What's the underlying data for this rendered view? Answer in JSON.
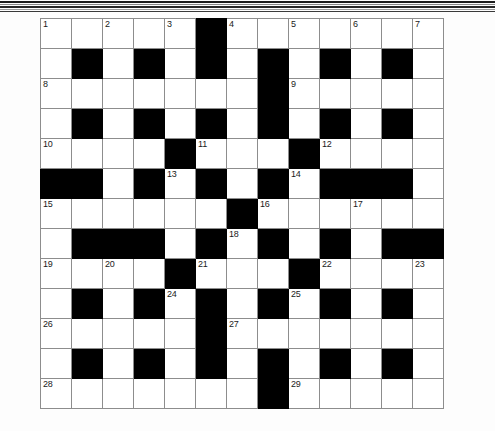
{
  "page": {
    "type": "crossword-puzzle-grid",
    "columns": 13,
    "rows": 13,
    "block_color": "#000000",
    "cell_color": "#ffffff",
    "border_color": "#8d8d8d",
    "number_color": "#1a1a1a"
  },
  "decorations": {
    "scan_bands": [
      "#1d1d1d",
      "#8a8a8a",
      "#272727",
      "#9b9b9b",
      "#3a3a3a"
    ]
  },
  "grid": {
    "legend": {
      "W": "open-cell",
      "B": "blocked-cell"
    },
    "cells": [
      [
        "W",
        "W",
        "W",
        "W",
        "W",
        "B",
        "W",
        "W",
        "W",
        "W",
        "W",
        "W",
        "W"
      ],
      [
        "W",
        "B",
        "W",
        "B",
        "W",
        "B",
        "W",
        "B",
        "W",
        "B",
        "W",
        "B",
        "W"
      ],
      [
        "W",
        "W",
        "W",
        "W",
        "W",
        "W",
        "W",
        "B",
        "W",
        "W",
        "W",
        "W",
        "W"
      ],
      [
        "W",
        "B",
        "W",
        "B",
        "W",
        "B",
        "W",
        "B",
        "W",
        "B",
        "W",
        "B",
        "W"
      ],
      [
        "W",
        "W",
        "W",
        "W",
        "B",
        "W",
        "W",
        "W",
        "B",
        "W",
        "W",
        "W",
        "W"
      ],
      [
        "B",
        "B",
        "W",
        "B",
        "W",
        "B",
        "W",
        "B",
        "W",
        "B",
        "B",
        "B",
        "W"
      ],
      [
        "W",
        "W",
        "W",
        "W",
        "W",
        "W",
        "B",
        "W",
        "W",
        "W",
        "W",
        "W",
        "W"
      ],
      [
        "W",
        "B",
        "B",
        "B",
        "W",
        "B",
        "W",
        "B",
        "W",
        "B",
        "W",
        "B",
        "B"
      ],
      [
        "W",
        "W",
        "W",
        "W",
        "B",
        "W",
        "W",
        "W",
        "B",
        "W",
        "W",
        "W",
        "W"
      ],
      [
        "W",
        "B",
        "W",
        "B",
        "W",
        "B",
        "W",
        "B",
        "W",
        "B",
        "W",
        "B",
        "W"
      ],
      [
        "W",
        "W",
        "W",
        "W",
        "W",
        "B",
        "W",
        "W",
        "W",
        "W",
        "W",
        "W",
        "W"
      ],
      [
        "W",
        "B",
        "W",
        "B",
        "W",
        "B",
        "W",
        "B",
        "W",
        "B",
        "W",
        "B",
        "W"
      ],
      [
        "W",
        "W",
        "W",
        "W",
        "W",
        "W",
        "W",
        "B",
        "W",
        "W",
        "W",
        "W",
        "W"
      ]
    ],
    "numbers": [
      [
        1,
        null,
        2,
        null,
        3,
        null,
        4,
        null,
        5,
        null,
        6,
        null,
        7
      ],
      [
        null,
        null,
        null,
        null,
        null,
        null,
        null,
        null,
        null,
        null,
        null,
        null,
        null
      ],
      [
        8,
        null,
        null,
        null,
        null,
        null,
        null,
        null,
        9,
        null,
        null,
        null,
        null
      ],
      [
        null,
        null,
        null,
        null,
        null,
        null,
        null,
        null,
        null,
        null,
        null,
        null,
        null
      ],
      [
        10,
        null,
        null,
        null,
        null,
        11,
        null,
        null,
        null,
        12,
        null,
        null,
        null
      ],
      [
        null,
        null,
        null,
        null,
        13,
        null,
        null,
        null,
        14,
        null,
        null,
        null,
        null
      ],
      [
        15,
        null,
        null,
        null,
        null,
        null,
        null,
        16,
        null,
        null,
        17,
        null,
        null
      ],
      [
        null,
        null,
        null,
        null,
        null,
        null,
        18,
        null,
        null,
        null,
        null,
        null,
        null
      ],
      [
        19,
        null,
        20,
        null,
        null,
        21,
        null,
        null,
        null,
        22,
        null,
        null,
        23
      ],
      [
        null,
        null,
        null,
        null,
        24,
        null,
        null,
        null,
        25,
        null,
        null,
        null,
        null
      ],
      [
        26,
        null,
        null,
        null,
        null,
        null,
        27,
        null,
        null,
        null,
        null,
        null,
        null
      ],
      [
        null,
        null,
        null,
        null,
        null,
        null,
        null,
        null,
        null,
        null,
        null,
        null,
        null
      ],
      [
        28,
        null,
        null,
        null,
        null,
        null,
        null,
        null,
        29,
        null,
        null,
        null,
        null
      ]
    ],
    "letters": [
      [
        "",
        "",
        "",
        "",
        "",
        "",
        "",
        "",
        "",
        "",
        "",
        "",
        ""
      ],
      [
        "",
        "",
        "",
        "",
        "",
        "",
        "",
        "",
        "",
        "",
        "",
        "",
        ""
      ],
      [
        "",
        "",
        "",
        "",
        "",
        "",
        "",
        "",
        "",
        "",
        "",
        "",
        ""
      ],
      [
        "",
        "",
        "",
        "",
        "",
        "",
        "",
        "",
        "",
        "",
        "",
        "",
        ""
      ],
      [
        "",
        "",
        "",
        "",
        "",
        "",
        "",
        "",
        "",
        "",
        "",
        "",
        ""
      ],
      [
        "",
        "",
        "",
        "",
        "",
        "",
        "",
        "",
        "",
        "",
        "",
        "",
        ""
      ],
      [
        "",
        "",
        "",
        "",
        "",
        "",
        "",
        "",
        "",
        "",
        "",
        "",
        ""
      ],
      [
        "",
        "",
        "",
        "",
        "",
        "",
        "",
        "",
        "",
        "",
        "",
        "",
        ""
      ],
      [
        "",
        "",
        "",
        "",
        "",
        "",
        "",
        "",
        "",
        "",
        "",
        "",
        ""
      ],
      [
        "",
        "",
        "",
        "",
        "",
        "",
        "",
        "",
        "",
        "",
        "",
        "",
        ""
      ],
      [
        "",
        "",
        "",
        "",
        "",
        "",
        "",
        "",
        "",
        "",
        "",
        "",
        ""
      ],
      [
        "",
        "",
        "",
        "",
        "",
        "",
        "",
        "",
        "",
        "",
        "",
        "",
        ""
      ],
      [
        "",
        "",
        "",
        "",
        "",
        "",
        "",
        "",
        "",
        "",
        "",
        "",
        ""
      ]
    ]
  }
}
